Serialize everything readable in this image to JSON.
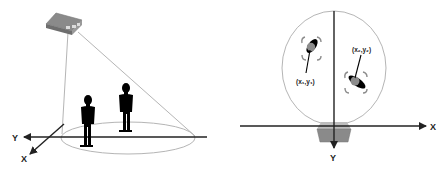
{
  "figure": {
    "left_panel": {
      "description": "3D perspective view of ceiling-mounted sensor covering floor area with two people",
      "axis_labels": {
        "y": "Y",
        "x": "X"
      },
      "sensor_icon": "ceiling-sensor-box",
      "people_count": 2
    },
    "right_panel": {
      "description": "Top-down view of sensor field of view with two tracked people",
      "axis_labels": {
        "x": "X",
        "y": "Y"
      },
      "person_1_label": "(x₁,y₁)",
      "person_2_label": "(x₂,y₂)",
      "sensor_icon": "sensor-trapezoid"
    },
    "colors": {
      "outline": "#b5b5b5",
      "axis": "#222222",
      "sensor_fill": "#8a8a8a",
      "sensor_dark": "#6e6e6e",
      "person_fill": "#000000",
      "head_gray": "#8c8c8c"
    }
  }
}
